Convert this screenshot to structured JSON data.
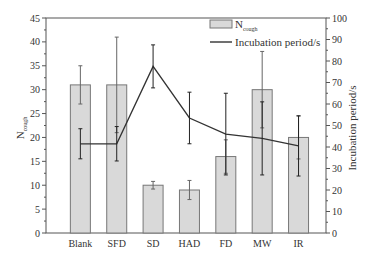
{
  "chart_data": {
    "type": "bar",
    "title": "",
    "categories": [
      "Blank",
      "SFD",
      "SD",
      "HAD",
      "FD",
      "MW",
      "IR"
    ],
    "xlabel": "",
    "ylabel": "N_cough",
    "ylabel_main": "N",
    "ylabel_sub": "cough",
    "y2label": "Incubation period/s",
    "ylim": [
      0,
      45
    ],
    "y2lim": [
      0,
      100
    ],
    "yticks": [
      0,
      5,
      10,
      15,
      20,
      25,
      30,
      35,
      40,
      45
    ],
    "y2ticks": [
      0,
      10,
      20,
      30,
      40,
      50,
      60,
      70,
      80,
      90,
      100
    ],
    "grid": false,
    "legend_position": "upper right",
    "series": [
      {
        "name": "N_cough",
        "legend_main": "N",
        "legend_sub": "cough",
        "type": "bar",
        "axis": "left",
        "values": [
          31,
          31,
          10,
          9,
          16,
          30,
          20
        ],
        "errors": [
          4,
          10,
          0.8,
          2,
          3.5,
          8,
          4.5
        ],
        "color": "#d9d9d9"
      },
      {
        "name": "Incubation period/s",
        "type": "line",
        "axis": "right",
        "values": [
          41.5,
          41.5,
          77.5,
          53.5,
          46,
          44,
          40.5
        ],
        "errors": [
          7,
          8,
          10,
          12,
          19,
          17,
          14
        ],
        "color": "#333333"
      }
    ]
  }
}
